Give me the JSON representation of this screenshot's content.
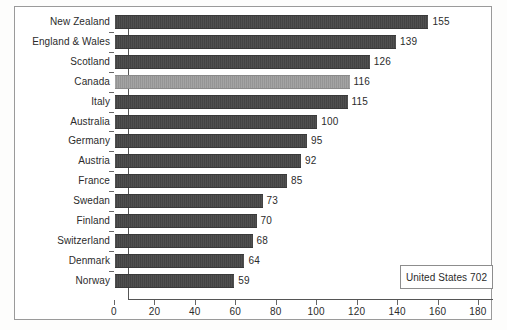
{
  "chart_data": {
    "type": "bar",
    "orientation": "horizontal",
    "title": "",
    "xlabel": "",
    "ylabel": "",
    "xlim": [
      0,
      180
    ],
    "xticks": [
      0,
      20,
      40,
      60,
      80,
      100,
      120,
      140,
      160,
      180
    ],
    "grid": false,
    "legend": null,
    "categories": [
      "New Zealand",
      "England & Wales",
      "Scotland",
      "Canada",
      "Italy",
      "Australia",
      "Germany",
      "Austria",
      "France",
      "Swedan",
      "Finland",
      "Switzerland",
      "Denmark",
      "Norway"
    ],
    "values": [
      155,
      139,
      126,
      116,
      115,
      100,
      95,
      92,
      85,
      73,
      70,
      68,
      64,
      59
    ],
    "highlight_category": "Canada",
    "annotations": [
      {
        "text": "United States 702"
      }
    ],
    "colors": {
      "bar": "#474747",
      "bar_highlight": "#9d9d9d",
      "axis": "#555555",
      "text": "#2b2b2b",
      "frame": "#9a9a9a",
      "background": "#ffffff"
    }
  }
}
